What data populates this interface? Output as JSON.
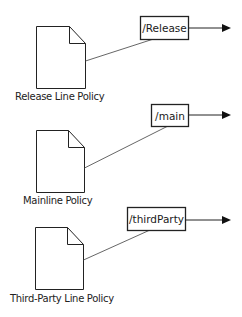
{
  "colors": {
    "background": "#ffffff",
    "stroke": "#222222",
    "connector": "#555555",
    "doc_fill": "#ffffff",
    "text": "#222222"
  },
  "policies": [
    {
      "id": "release",
      "label": "Release Line Policy",
      "icon": "document-icon"
    },
    {
      "id": "mainline",
      "label": "Mainline Policy",
      "icon": "document-icon"
    },
    {
      "id": "thirdparty",
      "label": "Third-Party Line Policy",
      "icon": "document-icon"
    }
  ],
  "branches": [
    {
      "id": "release",
      "label": "/Release",
      "arrow": "arrow-right-icon"
    },
    {
      "id": "main",
      "label": "/main",
      "arrow": "arrow-right-icon"
    },
    {
      "id": "thirdparty",
      "label": "/thirdParty",
      "arrow": "arrow-right-icon"
    }
  ]
}
